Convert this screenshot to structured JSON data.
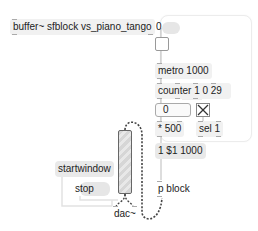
{
  "patcher": {
    "objects": {
      "buffer": "buffer~ sfblock vs_piano_tango",
      "number_top": "0",
      "metro": "metro 1000",
      "counter": "counter 1 0 29",
      "number_box": "0",
      "times": "* 500",
      "sel": "sel 1",
      "msg_list": "1 $1 1000",
      "pblock": "p block",
      "startwindow": "startwindow",
      "stop": "stop",
      "dac": "dac~"
    },
    "icons": {
      "toggle": "toggle-box",
      "bang_x": "x-box",
      "gain": "gain-slider"
    }
  }
}
